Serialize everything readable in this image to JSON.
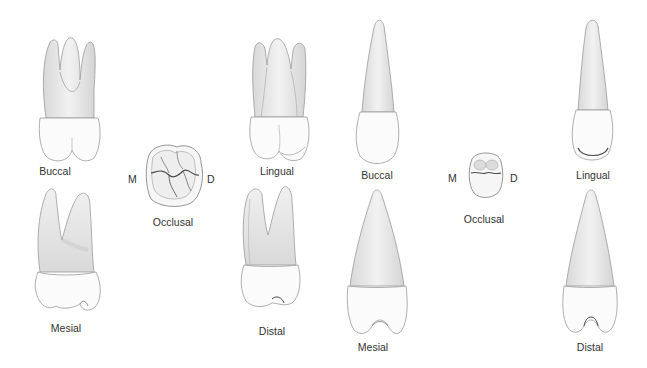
{
  "figure": {
    "background": "#ffffff",
    "colors": {
      "crown_fill": "#fbfbfb",
      "root_fill": "#e9e9e9",
      "root_shade": "#d2d2d2",
      "outline": "#9a9a9a",
      "groove": "#5a5a5a",
      "label_text": "#333333"
    },
    "groups": [
      {
        "id": "molar",
        "views": [
          {
            "name": "buccal",
            "label": "Buccal"
          },
          {
            "name": "occlusal",
            "label": "Occlusal",
            "mesial_marker": "M",
            "distal_marker": "D"
          },
          {
            "name": "lingual",
            "label": "Lingual"
          },
          {
            "name": "mesial",
            "label": "Mesial"
          },
          {
            "name": "distal",
            "label": "Distal"
          }
        ]
      },
      {
        "id": "anterior",
        "views": [
          {
            "name": "buccal",
            "label": "Buccal"
          },
          {
            "name": "occlusal",
            "label": "Occlusal",
            "mesial_marker": "M",
            "distal_marker": "D"
          },
          {
            "name": "lingual",
            "label": "Lingual"
          },
          {
            "name": "mesial",
            "label": "Mesial"
          },
          {
            "name": "distal",
            "label": "Distal"
          }
        ]
      }
    ]
  }
}
